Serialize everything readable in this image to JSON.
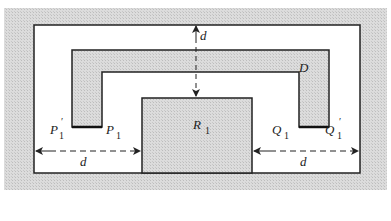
{
  "diagram": {
    "colors": {
      "shade": "#d6d6d6",
      "background": "#ffffff",
      "line": "#222222"
    },
    "labels": {
      "region_D": "D",
      "region_R": "R",
      "region_R_sub": "1",
      "P1_prime": "P",
      "P1_prime_sub": "1",
      "P1_prime_mark": "′",
      "P1": "P",
      "P1_sub": "1",
      "Q1": "Q",
      "Q1_sub": "1",
      "Q1_prime": "Q",
      "Q1_prime_sub": "1",
      "Q1_prime_mark": "′",
      "distance_top": "d",
      "distance_left": "d",
      "distance_right": "d"
    }
  }
}
